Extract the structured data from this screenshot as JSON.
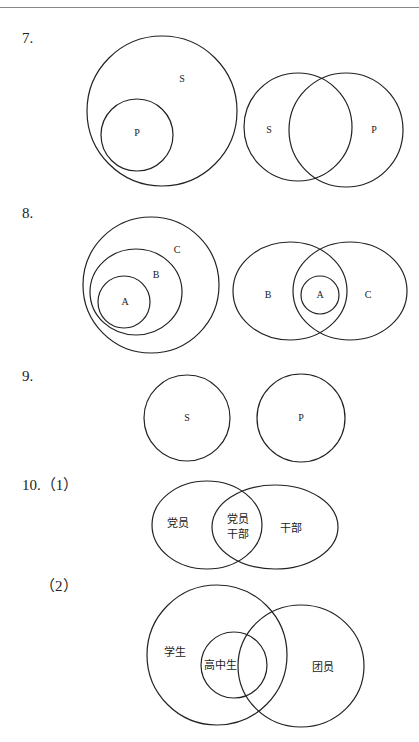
{
  "questions": [
    {
      "number": "7.",
      "diagrams": [
        {
          "labels": {
            "outer": "S",
            "inner": "P"
          }
        },
        {
          "labels": {
            "left": "S",
            "right": "P"
          }
        }
      ]
    },
    {
      "number": "8.",
      "diagrams": [
        {
          "labels": {
            "outer": "C",
            "middle": "B",
            "inner": "A"
          }
        },
        {
          "labels": {
            "left": "B",
            "center": "A",
            "right": "C"
          }
        }
      ]
    },
    {
      "number": "9.",
      "diagrams": [
        {
          "labels": {
            "left": "S",
            "right": "P"
          }
        }
      ]
    },
    {
      "number": "10.（1）",
      "diagrams": [
        {
          "labels": {
            "left": "党员",
            "overlap_line1": "党员",
            "overlap_line2": "干部",
            "right": "干部"
          }
        }
      ]
    },
    {
      "number": "（2）",
      "diagrams": [
        {
          "labels": {
            "outer": "学生",
            "inner": "高中生",
            "right": "团员"
          }
        }
      ]
    }
  ]
}
